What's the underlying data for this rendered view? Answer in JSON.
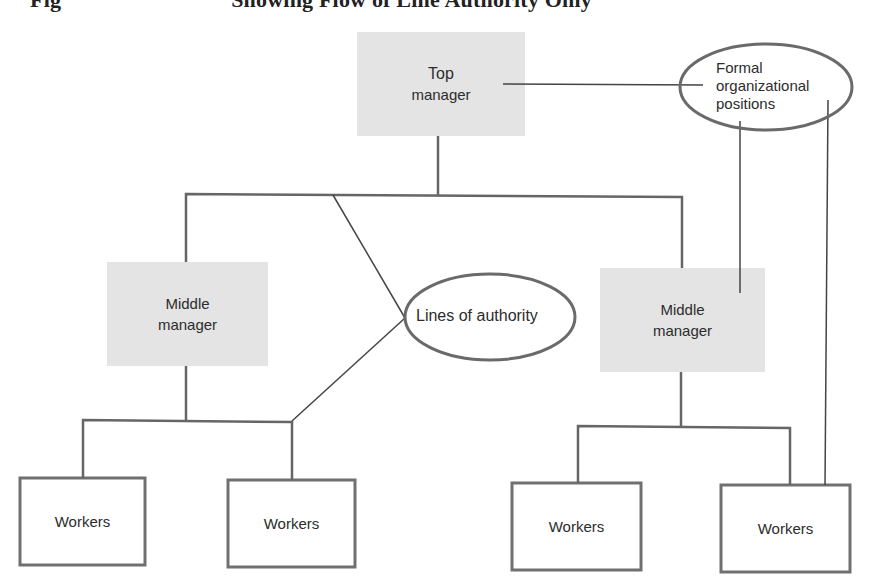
{
  "caption": {
    "prefix": "Fig",
    "text": "Showing Flow of Line Authority Only"
  },
  "colors": {
    "manager_fill": "#e4e4e4",
    "box_stroke": "#707070",
    "line": "#555555",
    "ellipse_stroke": "#6a6a6a",
    "text": "#2c2c2c"
  },
  "nodes": {
    "top_manager": {
      "line1": "Top",
      "line2": "manager"
    },
    "middle_manager_left": {
      "line1": "Middle",
      "line2": "manager"
    },
    "middle_manager_right": {
      "line1": "Middle",
      "line2": "manager"
    },
    "workers": [
      {
        "label": "Workers"
      },
      {
        "label": "Workers"
      },
      {
        "label": "Workers"
      },
      {
        "label": "Workers"
      }
    ]
  },
  "annotations": {
    "formal_positions": {
      "line1": "Formal",
      "line2": "organizational",
      "line3": "positions"
    },
    "lines_of_authority": {
      "label": "Lines of authority"
    }
  }
}
